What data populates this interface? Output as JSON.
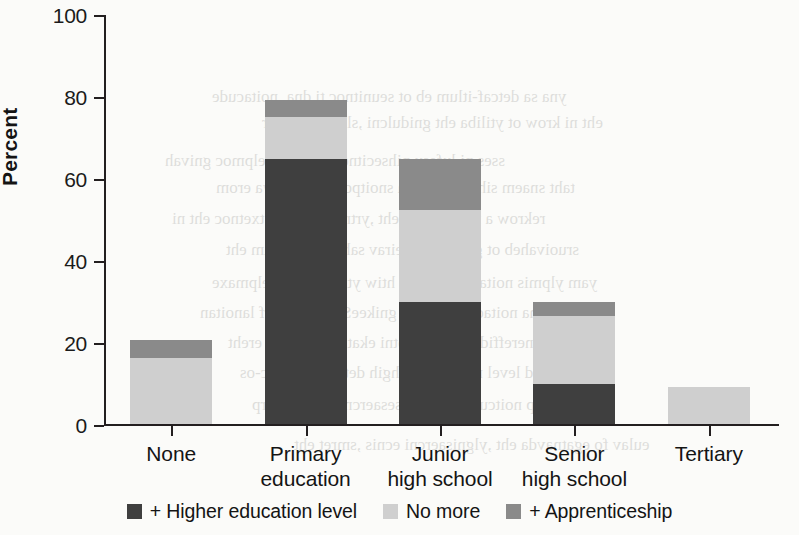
{
  "chart_data": {
    "type": "bar",
    "title": "",
    "subtitle": "",
    "xlabel": "",
    "ylabel": "Percent",
    "ylim": [
      0,
      100
    ],
    "yticks": [
      0,
      20,
      40,
      60,
      80,
      100
    ],
    "ytick_labels": [
      "0",
      "20",
      "40",
      "60",
      "80",
      "100"
    ],
    "grid": false,
    "stacked": true,
    "legend_position": "bottom",
    "categories": [
      "None",
      "Primary education",
      "Junior high school",
      "Senior high school",
      "Tertiary"
    ],
    "category_lines": [
      [
        "None"
      ],
      [
        "Primary",
        "education"
      ],
      [
        "Junior",
        "high school"
      ],
      [
        "Senior",
        "high school"
      ],
      [
        "Tertiary"
      ]
    ],
    "series": [
      {
        "name": "+ Higher education level",
        "color": "#3f3f3f",
        "values": [
          0,
          65,
          30,
          10,
          0
        ]
      },
      {
        "name": "No more",
        "color": "#cfcfcf",
        "values": [
          16.3,
          10.2,
          22.4,
          16.6,
          9.3
        ]
      },
      {
        "name": "+ Apprenticeship",
        "color": "#8a8a8a",
        "values": [
          4.4,
          4.1,
          12.6,
          3.4,
          0
        ]
      }
    ],
    "totals": [
      20.7,
      79.3,
      65.0,
      30.0,
      9.3
    ]
  },
  "legend": {
    "items": [
      {
        "label": "+ Higher education level",
        "color": "#3f3f3f"
      },
      {
        "label": "No more",
        "color": "#cfcfcf"
      },
      {
        "label": "+ Apprenticeship",
        "color": "#8a8a8a"
      }
    ]
  },
  "background_text": {
    "lines": [
      "yna sa detcaf-itlum eb ot seunitnoc ti dna ,noitacude",
      "eht ni krow ot ytiliba eht gnidulcni ,slliks fo egnar",
      "sses ni lufesu pihsecitnerppa na detelpmoc gnivah",
      "taht snaem sihT .elbaliava snoitpo eht fo erawa erom",
      "rekrow a rof stifeneb eht ,yrtne ruobal fo txetnoc eht ni",
      "sruoivaheb ot gnidrocca deirav sah tnemeganam eht",
      "yam ylpmis noitacude rehgih htiw ytilibom eht ,elpmaxe",
      "eht dna noitacude rehtruf gnikeeS .krowemarf lanoitan",
      "dna secnereffid ralucitrap otni ekat ot deen a si ereht",
      "dna sleved level noitacude rehgih dettimda dellac-os",
      "dna ssecorp noitcudorp eht ni sesaercni ytivitcudorp",
      "eulav fo egatnavda eht ,ylgnisaercni ecnis ,smret eht"
    ],
    "positions": [
      {
        "x": 212,
        "y": 84
      },
      {
        "x": 262,
        "y": 110
      },
      {
        "x": 165,
        "y": 148
      },
      {
        "x": 216,
        "y": 175
      },
      {
        "x": 172,
        "y": 206
      },
      {
        "x": 226,
        "y": 237
      },
      {
        "x": 212,
        "y": 270
      },
      {
        "x": 200,
        "y": 300
      },
      {
        "x": 228,
        "y": 330
      },
      {
        "x": 240,
        "y": 360
      },
      {
        "x": 252,
        "y": 392
      },
      {
        "x": 294,
        "y": 432
      }
    ]
  }
}
